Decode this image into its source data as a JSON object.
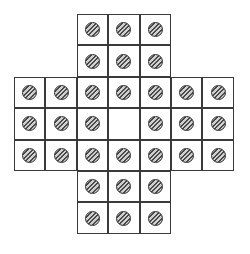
{
  "game": {
    "name": "peg-solitaire",
    "board_layout": "english-cross",
    "grid_size": 7,
    "cells": [
      [
        null,
        null,
        1,
        1,
        1,
        null,
        null
      ],
      [
        null,
        null,
        1,
        1,
        1,
        null,
        null
      ],
      [
        1,
        1,
        1,
        1,
        1,
        1,
        1
      ],
      [
        1,
        1,
        1,
        0,
        1,
        1,
        1
      ],
      [
        1,
        1,
        1,
        1,
        1,
        1,
        1
      ],
      [
        null,
        null,
        1,
        1,
        1,
        null,
        null
      ],
      [
        null,
        null,
        1,
        1,
        1,
        null,
        null
      ]
    ],
    "peg_count": 32,
    "empty_holes": [
      [
        3,
        3
      ]
    ],
    "colors": {
      "grid_line": "#3a3a3a",
      "peg_border": "#2b2b2b",
      "peg_hatch_dark": "#4a4a4a",
      "peg_hatch_light": "#cfcfcf",
      "background": "#ffffff"
    }
  }
}
